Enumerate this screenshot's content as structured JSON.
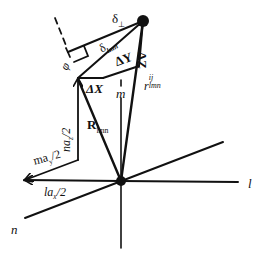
{
  "diagram": {
    "type": "vector geometry diagram",
    "colors": {
      "stroke": "#111111",
      "background": "#ffffff"
    },
    "axes": {
      "l": "l",
      "m": "m",
      "n": "n"
    },
    "labels": {
      "delta_perp": {
        "base": "δ",
        "sub": "⊥"
      },
      "delta_lmn": {
        "base": "δ",
        "sub": "lmn"
      },
      "delta_x": "ΔX",
      "delta_y": "ΔY",
      "delta_z": "ΔZ",
      "r_lmn_ij": {
        "base": "r",
        "sub": "lmn",
        "sup": "ij"
      },
      "R_lmn": {
        "base": "R",
        "sub": "lmn"
      },
      "na_z_2": {
        "pre": "na",
        "sub": "z",
        "post": "/2"
      },
      "ma_y_2": {
        "pre": "ma",
        "sub": "y",
        "post": "/2"
      },
      "la_x_2": {
        "pre": "la",
        "sub": "x",
        "post": "/2"
      },
      "phi": "φ"
    }
  }
}
